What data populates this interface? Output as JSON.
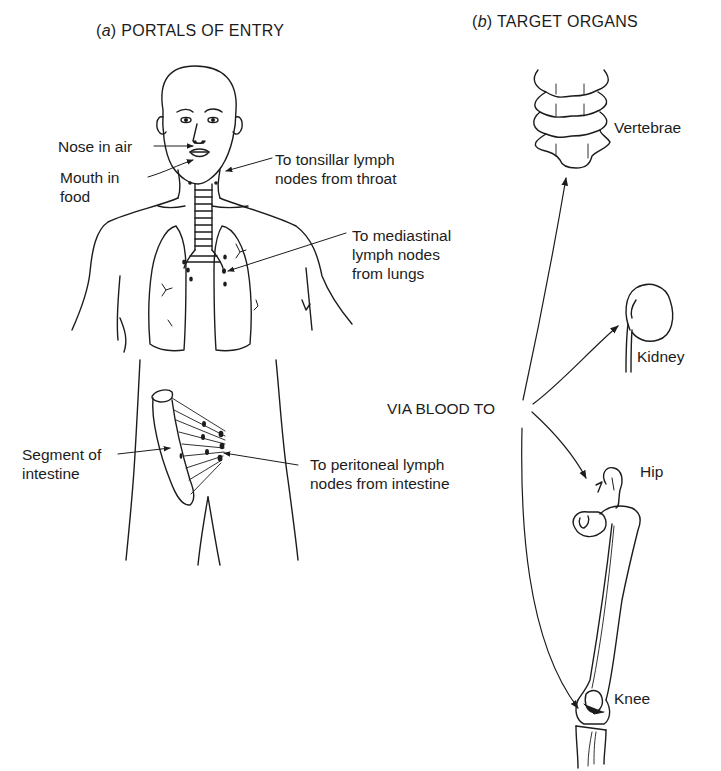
{
  "panel_a": {
    "letter": "a",
    "title": "PORTALS OF ENTRY",
    "labels": {
      "nose": "Nose in air",
      "mouth": "Mouth in\nfood",
      "tonsillar": "To tonsillar lymph\nnodes from throat",
      "mediastinal": "To mediastinal\nlymph nodes\nfrom lungs",
      "intestine_segment": "Segment of\nintestine",
      "peritoneal": "To peritoneal lymph\nnodes from intestine"
    }
  },
  "panel_b": {
    "letter": "b",
    "title": "TARGET ORGANS",
    "route_label": "VIA BLOOD TO",
    "organs": [
      "Vertebrae",
      "Kidney",
      "Hip",
      "Knee"
    ]
  },
  "colors": {
    "ink": "#1c1c1c",
    "background": "#ffffff"
  }
}
